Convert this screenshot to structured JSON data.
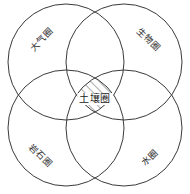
{
  "figure": {
    "type": "venn-4-circle-diagram",
    "background_color": "#ffffff",
    "stroke_color": "#3a3a3a",
    "hatch_color": "#4a4a4a",
    "label_color": "#2b2b2b"
  },
  "spheres": [
    {
      "id": "atmosphere",
      "label": "大气圈",
      "position": "top-left",
      "rotation_deg": -45,
      "x": 42,
      "y": 40
    },
    {
      "id": "biosphere",
      "label": "生物圈",
      "position": "top-right",
      "rotation_deg": 45,
      "x": 148,
      "y": 40
    },
    {
      "id": "lithosphere",
      "label": "岩石圈",
      "position": "bottom-left",
      "rotation_deg": 45,
      "x": 40,
      "y": 156
    },
    {
      "id": "hydrosphere",
      "label": "水圈",
      "position": "bottom-right",
      "rotation_deg": -45,
      "x": 150,
      "y": 158
    }
  ],
  "intersection": {
    "id": "pedosphere",
    "label": "土壤圈",
    "fill_style": "diagonal-hatch",
    "hatch_angle_deg": 45,
    "x": 95,
    "y": 99
  },
  "geometry": {
    "circles": [
      {
        "id": "circle-top-left",
        "cx": 66,
        "cy": 62,
        "r": 58
      },
      {
        "id": "circle-top-right",
        "cx": 124,
        "cy": 62,
        "r": 58
      },
      {
        "id": "circle-bottom-left",
        "cx": 66,
        "cy": 128,
        "r": 58
      },
      {
        "id": "circle-bottom-right",
        "cx": 124,
        "cy": 128,
        "r": 58
      }
    ],
    "stroke_width": 1
  }
}
